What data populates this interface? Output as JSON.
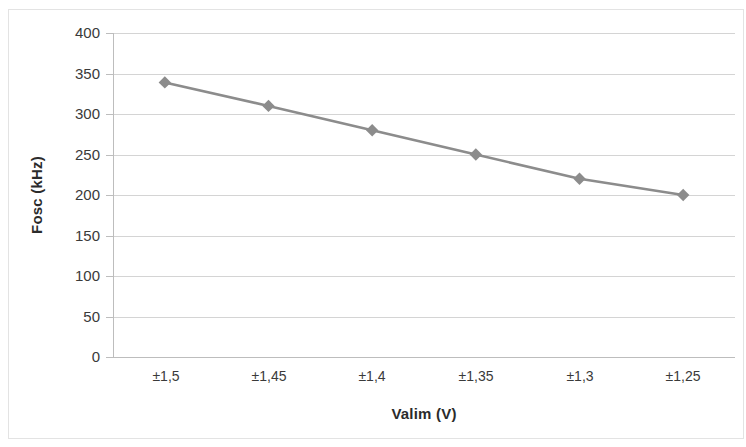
{
  "chart_data": {
    "type": "line",
    "title": "",
    "xlabel": "Valim (V)",
    "ylabel": "Fosc (kHz)",
    "categories": [
      "±1,5",
      "±1,45",
      "±1,4",
      "±1,35",
      "±1,3",
      "±1,25"
    ],
    "values": [
      339,
      310,
      280,
      250,
      220,
      200
    ],
    "series": [
      {
        "name": "Fosc",
        "values": [
          339,
          310,
          280,
          250,
          220,
          200
        ],
        "color": "#8c8c8c",
        "marker": "diamond"
      }
    ],
    "ylim": [
      0,
      400
    ],
    "y_ticks": [
      0,
      50,
      100,
      150,
      200,
      250,
      300,
      350,
      400
    ],
    "y_tick_labels": [
      "0",
      "50",
      "100",
      "150",
      "200",
      "250",
      "300",
      "350",
      "400"
    ],
    "grid": true,
    "grid_axis": "y",
    "legend": false,
    "legend_position": "none",
    "colors": {
      "series": "#8c8c8c",
      "gridline": "#d4d4d4",
      "axis": "#bdbdbd",
      "text": "#3a3a3a",
      "title_text": "#2b2b2b",
      "frame": "#e3e3e3",
      "background": "#ffffff"
    }
  },
  "axes": {
    "y_title": "Fosc (kHz)",
    "x_title": "Valim (V)"
  }
}
